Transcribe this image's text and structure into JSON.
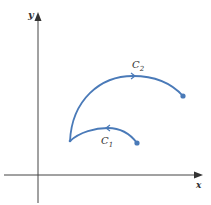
{
  "axes": {
    "x_label": "x",
    "y_label": "y"
  },
  "curves": [
    {
      "name": "C1",
      "label_main": "C",
      "label_sub": "1",
      "direction": "right-to-left"
    },
    {
      "name": "C2",
      "label_main": "C",
      "label_sub": "2",
      "direction": "left-to-right"
    }
  ],
  "colors": {
    "curve": "#4a7ab8",
    "axis": "#444444"
  }
}
